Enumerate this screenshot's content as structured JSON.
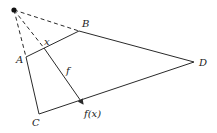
{
  "diagram": {
    "colors": {
      "stroke": "#2a2a2a",
      "background": "#ffffff"
    },
    "points": {
      "apex": {
        "x": 14,
        "y": 10
      },
      "A": {
        "x": 26,
        "y": 57
      },
      "B": {
        "x": 79,
        "y": 31
      },
      "C": {
        "x": 39,
        "y": 114
      },
      "D": {
        "x": 194,
        "y": 62
      },
      "x": {
        "x": 44,
        "y": 48
      },
      "fx": {
        "x": 84,
        "y": 105
      }
    },
    "labels": {
      "A": "A",
      "B": "B",
      "C": "C",
      "D": "D",
      "x": "x",
      "f": "f",
      "fx": "f(x)"
    }
  }
}
